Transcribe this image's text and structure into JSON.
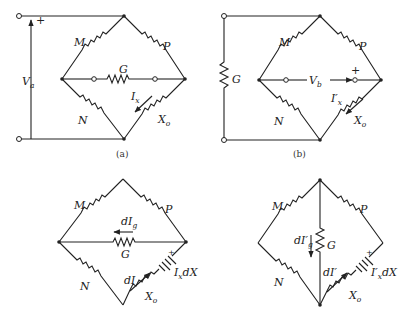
{
  "figure": {
    "panels": [
      {
        "id": "a",
        "caption": "(a)",
        "resistors": {
          "top_left": "M",
          "top_right": "P",
          "bottom_left": "N",
          "bottom_right": "X",
          "bottom_right_sub": "o",
          "middle": "G"
        },
        "source": {
          "label": "V",
          "sub": "a",
          "polarity": "+"
        },
        "current": {
          "label": "I",
          "sub": "x"
        }
      },
      {
        "id": "b",
        "caption": "(b)",
        "resistors": {
          "top_left": "M",
          "top_right": "P",
          "bottom_left": "N",
          "bottom_right": "X",
          "bottom_right_sub": "o",
          "left_external": "G"
        },
        "source": {
          "label": "V",
          "sub": "b",
          "polarity": "+"
        },
        "current": {
          "label": "I′",
          "sub": "x"
        }
      },
      {
        "id": "c",
        "resistors": {
          "top_left": "M",
          "top_right": "P",
          "bottom_left": "N",
          "bottom_right": "X",
          "bottom_right_sub": "o",
          "middle": "G"
        },
        "current_g": {
          "label": "dI",
          "sub": "g"
        },
        "current_x": {
          "label": "dI"
        },
        "emf": {
          "label": "I",
          "sub": "x",
          "suffix": "dX",
          "polarity": "+"
        }
      },
      {
        "id": "d",
        "resistors": {
          "top_left": "M",
          "top_right": "P",
          "bottom_left": "N",
          "bottom_right": "X",
          "bottom_right_sub": "o",
          "vertical": "G"
        },
        "current_g": {
          "label": "dI′",
          "sub": "g"
        },
        "current_x": {
          "label": "dI′"
        },
        "emf": {
          "label": "I′",
          "sub": "x",
          "suffix": "dX",
          "polarity": "+"
        }
      }
    ]
  }
}
